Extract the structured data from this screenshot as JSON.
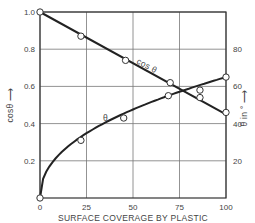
{
  "chart_data": {
    "type": "line",
    "title": "",
    "xlabel": "SURFACE COVERAGE BY PLASTIC",
    "ylabel_left": "cosθ",
    "ylabel_right": "θ in °",
    "xlim": [
      0,
      100
    ],
    "ylim_left": [
      0,
      1.0
    ],
    "ylim_right": [
      0,
      100
    ],
    "grid": true,
    "x_ticks": [
      "0",
      "25",
      "50",
      "75",
      "100"
    ],
    "y_ticks_left": [
      "0.2",
      "0.4",
      "0.6",
      "0.8",
      "1.0"
    ],
    "y_ticks_right": [
      "20",
      "40",
      "60",
      "80"
    ],
    "series": [
      {
        "name": "cos θ",
        "axis": "left",
        "label": "cos θ",
        "x": [
          0,
          22,
          46,
          70,
          86,
          100
        ],
        "values": [
          1.0,
          0.87,
          0.74,
          0.62,
          0.54,
          0.46
        ],
        "fit": "linear",
        "fit_points": [
          [
            0,
            1.0
          ],
          [
            100,
            0.45
          ]
        ]
      },
      {
        "name": "θ",
        "axis": "right",
        "label": "θ",
        "x": [
          0,
          22,
          45,
          69,
          86,
          100
        ],
        "values": [
          0,
          31,
          43,
          55,
          58,
          65
        ],
        "fit": "curve"
      }
    ]
  }
}
